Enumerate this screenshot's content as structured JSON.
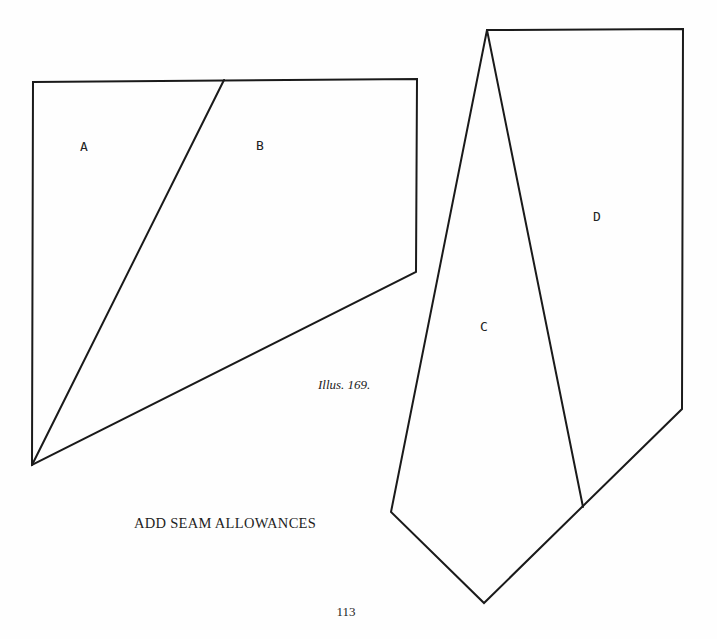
{
  "figure": {
    "caption": "Illus. 169.",
    "instruction": "ADD SEAM ALLOWANCES",
    "page_number": "113"
  },
  "pieces": {
    "A": {
      "label": "A"
    },
    "B": {
      "label": "B"
    },
    "C": {
      "label": "C"
    },
    "D": {
      "label": "D"
    }
  },
  "colors": {
    "line": "#1a1a1a",
    "text": "#222222",
    "background": "#fefefe"
  }
}
